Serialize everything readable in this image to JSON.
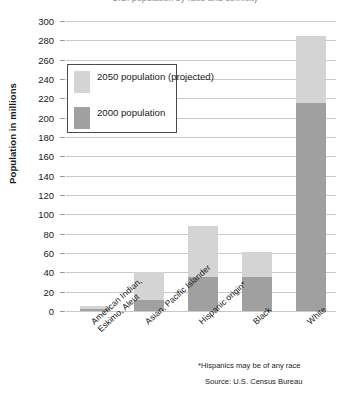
{
  "chart_data": {
    "type": "bar",
    "subtype": "stacked",
    "title": "U.S. population by race and ethnicity",
    "xlabel": "",
    "ylabel": "Population in millions",
    "ylim": [
      0,
      300
    ],
    "ytick_step": 20,
    "ytick_labels": [
      "300",
      "280",
      "260",
      "240",
      "220",
      "200",
      "180",
      "160",
      "140",
      "120",
      "100",
      "80",
      "60",
      "40",
      "20",
      "0"
    ],
    "yticks": [
      300,
      280,
      260,
      240,
      220,
      200,
      180,
      160,
      140,
      120,
      100,
      80,
      60,
      40,
      20,
      0
    ],
    "grid": true,
    "legend_position": "upper-left-inside",
    "categories": [
      "American Indian, Eskimo, Aleut",
      "Asian, Pacific Islander",
      "Hispanic origin*",
      "Black",
      "White"
    ],
    "category_lines": [
      [
        "American Indian,",
        "Eskimo, Aleut"
      ],
      [
        "Asian, Pacific Islander"
      ],
      [
        "Hispanic origin*"
      ],
      [
        "Black"
      ],
      [
        "White"
      ]
    ],
    "series": [
      {
        "name": "2000 population",
        "color": "#a0a0a0",
        "values": [
          2,
          11,
          35,
          35,
          215
        ]
      },
      {
        "name": "2050 population (projected)",
        "color": "#d4d4d4",
        "values": [
          5,
          40,
          88,
          61,
          284
        ]
      }
    ],
    "legend_entries": [
      {
        "label_line1": "2050 population",
        "label_line2": "(projected)",
        "color": "#d4d4d4"
      },
      {
        "label_line1": "2000 population",
        "label_line2": "",
        "color": "#a0a0a0"
      }
    ],
    "annotations": {
      "footnote": "*Hispanics may be of any race",
      "source": "Source: U.S. Census Bureau"
    },
    "colors": {
      "bar_2050": "#d4d4d4",
      "bar_2000": "#a0a0a0",
      "gridline": "#c9c9c9",
      "text": "#1a1a1a",
      "background": "#ffffff"
    }
  }
}
